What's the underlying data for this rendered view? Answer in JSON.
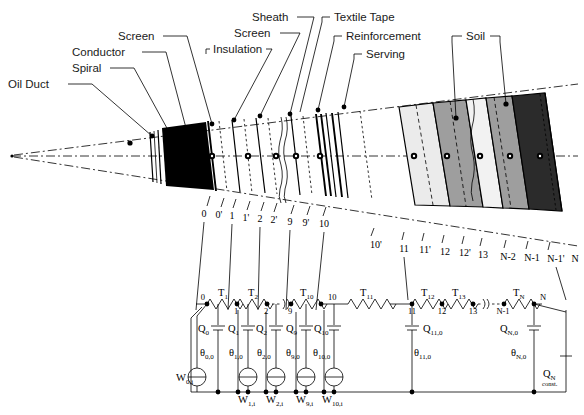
{
  "figure": {
    "background": "#ffffff",
    "ink": "#000000"
  },
  "callouts": [
    {
      "id": "oil-duct",
      "label": "Oil Duct",
      "x": 8,
      "y": 84,
      "dash_x1": 66,
      "dash_x2": 92,
      "leader": [
        [
          96,
          80
        ],
        [
          160,
          138
        ]
      ]
    },
    {
      "id": "spiral",
      "label": "Spiral",
      "x": 72,
      "y": 68,
      "dash_x1": 110,
      "dash_x2": 134,
      "leader": [
        [
          138,
          64
        ],
        [
          172,
          130
        ]
      ]
    },
    {
      "id": "conductor",
      "label": "Conductor",
      "x": 72,
      "y": 52,
      "dash_x1": 145,
      "dash_x2": 168,
      "leader": [
        [
          172,
          48
        ],
        [
          190,
          126
        ]
      ]
    },
    {
      "id": "screen-inner",
      "label": "Screen",
      "x": 118,
      "y": 36,
      "dash_x1": 163,
      "dash_x2": 187,
      "leader": [
        [
          191,
          32
        ],
        [
          216,
          122
        ]
      ]
    },
    {
      "id": "insulation",
      "label": "Insulation",
      "x": 213,
      "y": 49,
      "dash_x1": 206,
      "dash_x2": 210,
      "leader": [
        [
          264,
          44
        ],
        [
          236,
          120
        ]
      ]
    },
    {
      "id": "screen-outer",
      "label": "Screen",
      "x": 234,
      "y": 33,
      "dash_x1": 278,
      "dash_x2": 300,
      "leader": [
        [
          302,
          29
        ],
        [
          262,
          116
        ]
      ]
    },
    {
      "id": "sheath",
      "label": "Sheath",
      "x": 252,
      "y": 17,
      "dash_x1": 297,
      "dash_x2": 316,
      "leader": [
        [
          318,
          13
        ],
        [
          292,
          114
        ]
      ]
    },
    {
      "id": "textile-tape",
      "label": "Textile Tape",
      "x": 330,
      "y": 17,
      "dash_x1": 318,
      "dash_x2": 322,
      "leader": [
        [
          326,
          13
        ],
        [
          300,
          112
        ]
      ]
    },
    {
      "id": "reinforcement",
      "label": "Reinforcement",
      "x": 342,
      "y": 36,
      "dash_x1": 330,
      "dash_x2": 334,
      "leader": [
        [
          338,
          32
        ],
        [
          316,
          110
        ]
      ]
    },
    {
      "id": "serving",
      "label": "Serving",
      "x": 362,
      "y": 54,
      "dash_x1": 350,
      "dash_x2": 354,
      "leader": [
        [
          358,
          50
        ],
        [
          346,
          107
        ]
      ]
    },
    {
      "id": "soil-a",
      "label": "Soil",
      "x": 466,
      "y": 36,
      "dash_x1": 452,
      "dash_x2": 458,
      "leader": [
        [
          456,
          32
        ],
        [
          456,
          118
        ]
      ]
    },
    {
      "id": "soil-b",
      "label": "",
      "x": 0,
      "y": 0,
      "dash_x1": 0,
      "dash_x2": 0,
      "leader": [
        [
          508,
          32
        ],
        [
          508,
          104
        ]
      ]
    }
  ],
  "boundary_numbers_top": [
    "0",
    "0'",
    "1",
    "1'",
    "2",
    "2'",
    "9",
    "9'",
    "10"
  ],
  "boundary_numbers_bottom": [
    "10'",
    "11",
    "11'",
    "12",
    "12'",
    "13",
    "N-2",
    "N-1",
    "N-1'",
    "N"
  ],
  "axis": {
    "apex_x": 12,
    "apex_y": 156,
    "centerline_y": 156
  },
  "circuit": {
    "nodes_left": [
      "0",
      "1",
      "2",
      "9",
      "10"
    ],
    "nodes_right": [
      "11",
      "12",
      "13",
      "N-1",
      "N"
    ],
    "resistors_left": [
      "T1",
      "T2",
      "T10"
    ],
    "resistors_right": [
      "T11",
      "T12",
      "T13",
      "TN"
    ],
    "resistor_labels": [
      {
        "id": "T1",
        "base": "T",
        "sub": "1",
        "x": 218,
        "y": 296
      },
      {
        "id": "T2",
        "base": "T",
        "sub": "2",
        "x": 248,
        "y": 296
      },
      {
        "id": "T10",
        "base": "T",
        "sub": "10",
        "x": 305,
        "y": 296
      },
      {
        "id": "T11",
        "base": "T",
        "sub": "11",
        "x": 363,
        "y": 296
      },
      {
        "id": "T12",
        "base": "T",
        "sub": "12",
        "x": 425,
        "y": 296
      },
      {
        "id": "T13",
        "base": "T",
        "sub": "13",
        "x": 456,
        "y": 296
      },
      {
        "id": "TN",
        "base": "T",
        "sub": "N",
        "x": 517,
        "y": 296
      }
    ],
    "node_labels": [
      {
        "id": "n0",
        "text": "0",
        "x": 207,
        "y": 302
      },
      {
        "id": "n1",
        "text": "1",
        "x": 238,
        "y": 317
      },
      {
        "id": "n2",
        "text": "2",
        "x": 268,
        "y": 317
      },
      {
        "id": "n9",
        "text": "9",
        "x": 290,
        "y": 317
      },
      {
        "id": "n10",
        "text": "10",
        "x": 322,
        "y": 303
      },
      {
        "id": "n11",
        "text": "11",
        "x": 413,
        "y": 317
      },
      {
        "id": "n12",
        "text": "12",
        "x": 444,
        "y": 317
      },
      {
        "id": "n13",
        "text": "13",
        "x": 473,
        "y": 317
      },
      {
        "id": "nN1",
        "text": "N-1",
        "x": 498,
        "y": 317
      },
      {
        "id": "nN",
        "text": "N",
        "x": 539,
        "y": 302
      }
    ],
    "capacitors": [
      {
        "id": "Q0",
        "base": "Q",
        "sub": "0",
        "x": 202,
        "y": 331
      },
      {
        "id": "Q1",
        "base": "Q",
        "sub": "1",
        "x": 232,
        "y": 331
      },
      {
        "id": "Q2",
        "base": "Q",
        "sub": "2",
        "x": 262,
        "y": 331
      },
      {
        "id": "Q9",
        "base": "Q",
        "sub": "9",
        "x": 287,
        "y": 331
      },
      {
        "id": "Q10",
        "base": "Q",
        "sub": "10",
        "x": 313,
        "y": 331
      },
      {
        "id": "Q11",
        "base": "Q",
        "sub": "11,0",
        "x": 415,
        "y": 331
      },
      {
        "id": "QN",
        "base": "Q",
        "sub": "N,0",
        "x": 514,
        "y": 331
      }
    ],
    "temperatures": [
      {
        "id": "th0",
        "base": "θ",
        "sub": "0,0",
        "x": 203,
        "y": 355
      },
      {
        "id": "th1",
        "base": "θ",
        "sub": "1,0",
        "x": 233,
        "y": 355
      },
      {
        "id": "th2",
        "base": "θ",
        "sub": "2,0",
        "x": 262,
        "y": 355
      },
      {
        "id": "th9",
        "base": "θ",
        "sub": "9,0",
        "x": 288,
        "y": 355
      },
      {
        "id": "th10",
        "base": "θ",
        "sub": "10,0",
        "x": 313,
        "y": 355
      },
      {
        "id": "th11",
        "base": "θ",
        "sub": "11,0",
        "x": 413,
        "y": 355
      },
      {
        "id": "thN",
        "base": "θ",
        "sub": "N,0",
        "x": 513,
        "y": 355
      }
    ],
    "sources": [
      {
        "id": "W0",
        "base": "W",
        "sub": "0,i",
        "cx": 197,
        "cy": 377,
        "label_x": 176,
        "label_y": 381
      },
      {
        "id": "W1",
        "base": "W",
        "sub": "1,i",
        "cx": 248,
        "cy": 377,
        "label_x": 238,
        "label_y": 400
      },
      {
        "id": "W2",
        "base": "W",
        "sub": "2,i",
        "cx": 276,
        "cy": 377,
        "label_x": 266,
        "label_y": 400
      },
      {
        "id": "W9",
        "base": "W",
        "sub": "9,i",
        "cx": 306,
        "cy": 377,
        "label_x": 296,
        "label_y": 400
      },
      {
        "id": "W10",
        "base": "W",
        "sub": "10,i",
        "cx": 334,
        "cy": 377,
        "label_x": 322,
        "label_y": 400
      }
    ],
    "const_source": {
      "base": "Q",
      "sub": "N",
      "caption": "const.",
      "x": 546,
      "y": 375,
      "caption_x": 543,
      "caption_y": 385
    }
  }
}
